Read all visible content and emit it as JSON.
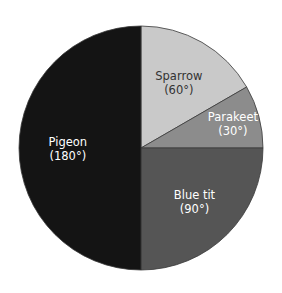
{
  "chart_data": {
    "type": "pie",
    "title": "",
    "unit": "degrees",
    "start_angle_deg_clockwise_from_top": 0,
    "slices": [
      {
        "label": "Sparrow",
        "value": 60,
        "value_label": "(60°)",
        "color": "#c9c9c9",
        "text_color": "#333333"
      },
      {
        "label": "Parakeet",
        "value": 30,
        "value_label": "(30°)",
        "color": "#8c8c8c",
        "text_color": "#ffffff"
      },
      {
        "label": "Blue tit",
        "value": 90,
        "value_label": "(90°)",
        "color": "#555555",
        "text_color": "#ffffff"
      },
      {
        "label": "Pigeon",
        "value": 180,
        "value_label": "(180°)",
        "color": "#141414",
        "text_color": "#ffffff"
      }
    ],
    "legend": null
  }
}
